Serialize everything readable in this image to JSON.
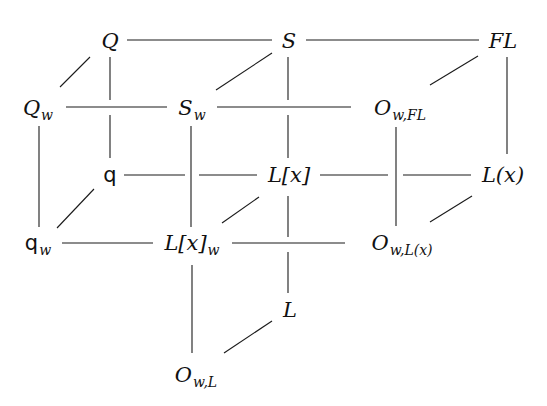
{
  "diagram": {
    "type": "commutative-cube-lattice",
    "nodes": [
      {
        "id": "Q",
        "base": "Q",
        "sub": "",
        "x": 110,
        "y": 41
      },
      {
        "id": "S",
        "base": "S",
        "sub": "",
        "x": 289,
        "y": 41
      },
      {
        "id": "FL",
        "base": "FL",
        "sub": "",
        "x": 497,
        "y": 41
      },
      {
        "id": "Qw",
        "base": "Q",
        "sub": "w",
        "x": 38,
        "y": 108
      },
      {
        "id": "Sw",
        "base": "S",
        "sub": "w",
        "x": 190,
        "y": 108
      },
      {
        "id": "OwFL",
        "base": "O",
        "sub": "w,FL",
        "x": 396,
        "y": 108
      },
      {
        "id": "q",
        "base": "q",
        "sub": "",
        "x": 110,
        "y": 175
      },
      {
        "id": "Lx",
        "base": "L[x]",
        "sub": "",
        "x": 289,
        "y": 175
      },
      {
        "id": "Lpx",
        "base": "L(x)",
        "sub": "",
        "x": 497,
        "y": 175
      },
      {
        "id": "qw",
        "base": "q",
        "sub": "w",
        "x": 38,
        "y": 243
      },
      {
        "id": "Lxw",
        "base": "L[x]",
        "sub": "w",
        "x": 190,
        "y": 243
      },
      {
        "id": "OwLx",
        "base": "O",
        "sub": "w,L(x)",
        "x": 396,
        "y": 243
      },
      {
        "id": "L",
        "base": "L",
        "sub": "",
        "x": 289,
        "y": 310
      },
      {
        "id": "OwL",
        "base": "O",
        "sub": "w,L",
        "x": 190,
        "y": 375
      }
    ],
    "edges": [
      [
        "Q",
        "S"
      ],
      [
        "S",
        "FL"
      ],
      [
        "Qw",
        "Sw"
      ],
      [
        "Sw",
        "OwFL"
      ],
      [
        "q",
        "Lx"
      ],
      [
        "Lx",
        "Lpx"
      ],
      [
        "qw",
        "Lxw"
      ],
      [
        "Lxw",
        "OwLx"
      ],
      [
        "Q",
        "Qw"
      ],
      [
        "S",
        "Sw"
      ],
      [
        "FL",
        "OwFL"
      ],
      [
        "q",
        "qw"
      ],
      [
        "Lx",
        "Lxw"
      ],
      [
        "Lpx",
        "OwLx"
      ],
      [
        "L",
        "OwL"
      ],
      [
        "Q",
        "q"
      ],
      [
        "Qw",
        "qw"
      ],
      [
        "S",
        "Lx"
      ],
      [
        "Sw",
        "Lxw"
      ],
      [
        "FL",
        "Lpx"
      ],
      [
        "OwFL",
        "OwLx"
      ],
      [
        "Lx",
        "L"
      ],
      [
        "Lxw",
        "OwL"
      ]
    ]
  }
}
